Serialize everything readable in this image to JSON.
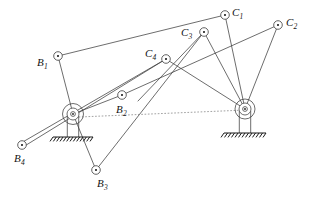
{
  "figure": {
    "title": "",
    "background_color": "#ffffff",
    "line_color": "#3c3c3c",
    "dotted_color": "#8a8a8a",
    "ground_color": "#1a1a1a",
    "label_color": "#141414",
    "width": 319,
    "height": 200
  },
  "pivots": [
    {
      "id": "pivot-left",
      "name": "left-ground-pivot",
      "x": 73,
      "y": 114,
      "outer_r": 10.5,
      "inner_r": 6.0,
      "hub_r": 2.4,
      "base_y": 137,
      "base_half_w": 20
    },
    {
      "id": "pivot-right",
      "name": "right-ground-pivot",
      "x": 245,
      "y": 109,
      "outer_r": 10.0,
      "inner_r": 6.0,
      "hub_r": 2.4,
      "base_y": 133,
      "base_half_w": 21
    }
  ],
  "nodes": [
    {
      "id": "B1",
      "label": "B",
      "sub": "1",
      "x": 58,
      "y": 56,
      "label_x": 37,
      "label_y": 57,
      "r": 4.3
    },
    {
      "id": "B2",
      "label": "B",
      "sub": "2",
      "x": 122,
      "y": 95,
      "label_x": 116,
      "label_y": 104,
      "r": 4.3
    },
    {
      "id": "B3",
      "label": "B",
      "sub": "3",
      "x": 96,
      "y": 170,
      "label_x": 97,
      "label_y": 178,
      "r": 4.3
    },
    {
      "id": "B4",
      "label": "B",
      "sub": "4",
      "x": 22,
      "y": 145,
      "label_x": 14,
      "label_y": 153,
      "r": 4.3
    },
    {
      "id": "C1",
      "label": "C",
      "sub": "1",
      "x": 225,
      "y": 15,
      "label_x": 232,
      "label_y": 7,
      "r": 4.3
    },
    {
      "id": "C2",
      "label": "C",
      "sub": "2",
      "x": 278,
      "y": 25,
      "label_x": 286,
      "label_y": 17,
      "r": 4.3
    },
    {
      "id": "C3",
      "label": "C",
      "sub": "3",
      "x": 204,
      "y": 32,
      "label_x": 181,
      "label_y": 27,
      "r": 4.3
    },
    {
      "id": "C4",
      "label": "C",
      "sub": "4",
      "x": 166,
      "y": 59,
      "label_x": 145,
      "label_y": 48,
      "r": 4.3
    }
  ],
  "links": [
    {
      "name": "link-B1-C1",
      "x1": 58,
      "y1": 56,
      "x2": 225,
      "y2": 15
    },
    {
      "name": "link-B1-pivotL",
      "x1": 58,
      "y1": 56,
      "x2": 73,
      "y2": 114
    },
    {
      "name": "link-B2-C2",
      "x1": 122,
      "y1": 95,
      "x2": 278,
      "y2": 25
    },
    {
      "name": "link-B2-pivotL",
      "x1": 122,
      "y1": 95,
      "x2": 73,
      "y2": 114
    },
    {
      "name": "link-B3-C3",
      "x1": 96,
      "y1": 170,
      "x2": 204,
      "y2": 32
    },
    {
      "name": "link-B3-pivotL",
      "x1": 96,
      "y1": 170,
      "x2": 73,
      "y2": 114
    },
    {
      "name": "link-B4-C4-upper",
      "x1": 21,
      "y1": 143,
      "x2": 166,
      "y2": 59
    },
    {
      "name": "link-B4-C4-lower",
      "x1": 23,
      "y1": 147,
      "x2": 166,
      "y2": 59
    },
    {
      "name": "link-C1-pivotR",
      "x1": 225,
      "y1": 15,
      "x2": 245,
      "y2": 109
    },
    {
      "name": "link-C2-pivotR",
      "x1": 278,
      "y1": 25,
      "x2": 245,
      "y2": 109
    },
    {
      "name": "link-C3-pivotR",
      "x1": 204,
      "y1": 32,
      "x2": 245,
      "y2": 109
    },
    {
      "name": "link-C4-pivotR",
      "x1": 166,
      "y1": 59,
      "x2": 245,
      "y2": 109
    },
    {
      "name": "link-C3-cross",
      "x1": 204,
      "y1": 32,
      "x2": 138,
      "y2": 101
    }
  ],
  "reference_line": {
    "name": "centerline",
    "x1": 79,
    "y1": 117,
    "x2": 246,
    "y2": 110
  },
  "hatch": {
    "tick_count": 13
  }
}
